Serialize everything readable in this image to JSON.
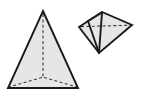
{
  "figure": {
    "canvas": {
      "width": 143,
      "height": 99,
      "background": "#ffffff"
    },
    "colors": {
      "face_fill": "#e6e6e6",
      "visible_edge": "#1a1a1a",
      "hidden_edge": "#3a3a3a",
      "background": "#ffffff"
    },
    "shapes": [
      {
        "id": "left-pyramid",
        "name": "tall-triangular-pyramid",
        "label": "",
        "vertices": {
          "apex": [
            43,
            11
          ],
          "base_front_left": [
            8,
            88
          ],
          "base_front_right": [
            78,
            88
          ],
          "base_back_hidden": [
            43,
            77
          ]
        },
        "visible_outline": "43,11 78,88 8,88",
        "hidden_edges": [
          {
            "name": "apex-to-back-base-vertex",
            "from": [
              43,
              12
            ],
            "to": [
              43,
              77
            ]
          },
          {
            "name": "back-base-vertex-to-front-left",
            "from": [
              43,
              77
            ],
            "to": [
              9,
              87
            ]
          },
          {
            "name": "back-base-vertex-to-front-right",
            "from": [
              43,
              77
            ],
            "to": [
              77,
              87
            ]
          }
        ]
      },
      {
        "id": "right-pyramid",
        "name": "small-tilted-triangular-pyramid",
        "label": "",
        "vertices": {
          "left": [
            79,
            27
          ],
          "top": [
            102,
            12
          ],
          "right": [
            132,
            25
          ],
          "bottom": [
            99,
            53
          ]
        },
        "visible_outline": "79,27 102,12 132,25 99,53",
        "visible_internal_edges": [
          {
            "name": "top-to-bottom-edge",
            "from": [
              102,
              12
            ],
            "to": [
              99,
              53
            ]
          },
          {
            "name": "left-upper-to-bottom-edge",
            "from": [
              88,
              21
            ],
            "to": [
              99,
              53
            ]
          }
        ],
        "hidden_edges": [
          {
            "name": "left-to-right-base-diagonal",
            "from": [
              80,
              27
            ],
            "to": [
              131,
              25
            ]
          }
        ]
      }
    ]
  }
}
